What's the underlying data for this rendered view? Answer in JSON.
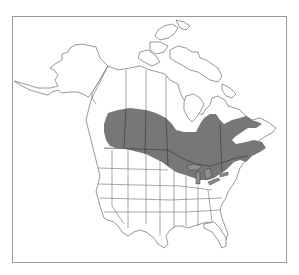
{
  "map": {
    "type": "species-range-map",
    "region": "North America",
    "frame": {
      "x": 12,
      "y": 16,
      "width": 275,
      "height": 247,
      "border_color": "#9a9a9a"
    },
    "colors": {
      "background": "#ffffff",
      "land": "#ffffff",
      "outline": "#6d6d6d",
      "range_fill": "#777777",
      "range_borders": "#3e3e3e"
    },
    "range_description": "Shaded band across southern Canada (BC interior to Atlantic provinces) and northern Great Lakes / New England US",
    "labels": []
  }
}
